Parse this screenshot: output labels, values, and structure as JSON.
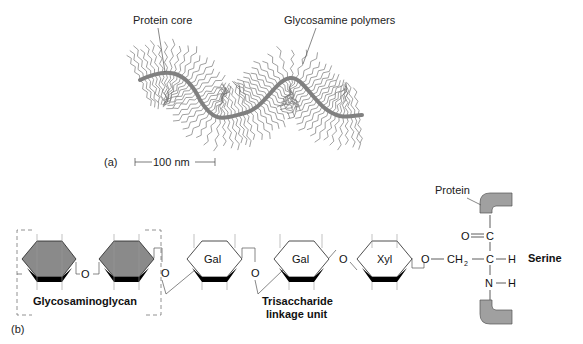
{
  "panel_a": {
    "label": "(a)",
    "protein_core_label": "Protein core",
    "polymers_label": "Glycosamine polymers",
    "scale_bar_label": "100 nm"
  },
  "panel_b": {
    "label": "(b)",
    "glycosaminoglycan_label": "Glycosaminoglycan",
    "trisaccharide_label_line1": "Trisaccharide",
    "trisaccharide_label_line2": "linkage unit",
    "sugars": [
      "Gal",
      "Gal",
      "Xyl"
    ],
    "oxygen": "O",
    "protein_label": "Protein",
    "serine_label": "Serine",
    "atoms": {
      "o_double": "O",
      "c_top": "C",
      "c_mid": "C",
      "ch2": "CH",
      "ch2_sub": "2",
      "h_right": "H",
      "n": "N",
      "h_n": "H"
    }
  },
  "colors": {
    "protein_core": "#808080",
    "gag_ring_fill": "#8a8a8a",
    "protein_block": "#a0a0a0",
    "line": "#555555"
  }
}
